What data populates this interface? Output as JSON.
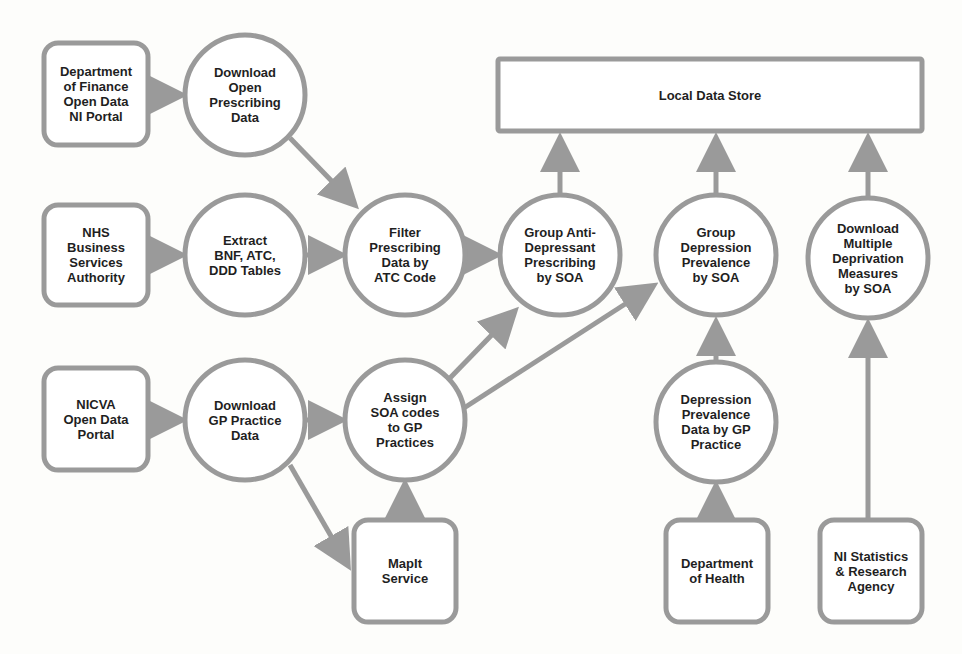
{
  "colors": {
    "stroke": "#9a9a9a",
    "fill": "#ffffff",
    "text": "#1f1f1f",
    "background": "#fdfdfb"
  },
  "nodes": {
    "dof_portal": {
      "label": "Department\nof Finance\nOpen Data\nNI Portal",
      "shape": "rounded-box"
    },
    "download_prescribing": {
      "label": "Download\nOpen\nPrescribing\nData",
      "shape": "circle"
    },
    "local_store": {
      "label": "Local Data Store",
      "shape": "box"
    },
    "nhs_bsa": {
      "label": "NHS\nBusiness\nServices\nAuthority",
      "shape": "rounded-box"
    },
    "extract_tables": {
      "label": "Extract\nBNF, ATC,\nDDD Tables",
      "shape": "circle"
    },
    "filter_atc": {
      "label": "Filter\nPrescribing\nData by\nATC Code",
      "shape": "circle"
    },
    "group_antidep": {
      "label": "Group Anti-\nDepressant\nPrescribing\nby SOA",
      "shape": "circle"
    },
    "group_depression": {
      "label": "Group\nDepression\nPrevalence\nby SOA",
      "shape": "circle"
    },
    "download_deprivation": {
      "label": "Download\nMultiple\nDeprivation\nMeasures\nby SOA",
      "shape": "circle"
    },
    "nicva_portal": {
      "label": "NICVA\nOpen Data\nPortal",
      "shape": "rounded-box"
    },
    "download_gp": {
      "label": "Download\nGP Practice\nData",
      "shape": "circle"
    },
    "assign_soa": {
      "label": "Assign\nSOA codes\nto GP\nPractices",
      "shape": "circle"
    },
    "depression_data_gp": {
      "label": "Depression\nPrevalence\nData by GP\nPractice",
      "shape": "circle"
    },
    "mapit": {
      "label": "MapIt\nService",
      "shape": "rounded-box"
    },
    "dept_health": {
      "label": "Department\nof Health",
      "shape": "rounded-box"
    },
    "nisra": {
      "label": "NI Statistics\n& Research\nAgency",
      "shape": "rounded-box"
    }
  },
  "edges": [
    {
      "from": "dof_portal",
      "to": "download_prescribing"
    },
    {
      "from": "download_prescribing",
      "to": "filter_atc"
    },
    {
      "from": "nhs_bsa",
      "to": "extract_tables"
    },
    {
      "from": "extract_tables",
      "to": "filter_atc"
    },
    {
      "from": "filter_atc",
      "to": "group_antidep"
    },
    {
      "from": "group_antidep",
      "to": "local_store"
    },
    {
      "from": "group_depression",
      "to": "local_store"
    },
    {
      "from": "download_deprivation",
      "to": "local_store"
    },
    {
      "from": "nicva_portal",
      "to": "download_gp"
    },
    {
      "from": "download_gp",
      "to": "assign_soa"
    },
    {
      "from": "download_gp",
      "to": "mapit"
    },
    {
      "from": "mapit",
      "to": "assign_soa"
    },
    {
      "from": "assign_soa",
      "to": "group_antidep"
    },
    {
      "from": "assign_soa",
      "to": "group_depression"
    },
    {
      "from": "depression_data_gp",
      "to": "group_depression"
    },
    {
      "from": "dept_health",
      "to": "depression_data_gp"
    },
    {
      "from": "nisra",
      "to": "download_deprivation"
    }
  ]
}
